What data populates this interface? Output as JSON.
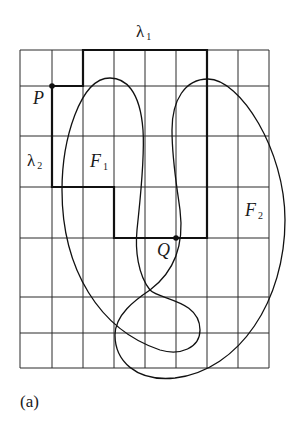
{
  "figure": {
    "caption": "(a)",
    "labels": {
      "lambda1": {
        "text": "λ",
        "sub": "1"
      },
      "lambda2": {
        "text": "λ",
        "sub": "2"
      },
      "P": {
        "text": "P"
      },
      "Q": {
        "text": "Q"
      },
      "F1": {
        "text": "F",
        "sub": "1"
      },
      "F2": {
        "text": "F",
        "sub": "2"
      }
    },
    "grid": {
      "x_lines": [
        20,
        52,
        83,
        114,
        145,
        176,
        207,
        238,
        269
      ],
      "y_lines": [
        50,
        86,
        136,
        187,
        238,
        297,
        333,
        368
      ],
      "columns": 8,
      "rows": 7
    },
    "points": {
      "P": [
        52,
        86
      ],
      "Q": [
        176,
        238
      ]
    },
    "colors": {
      "line": "#1a1a1a",
      "background": "#ffffff"
    }
  }
}
